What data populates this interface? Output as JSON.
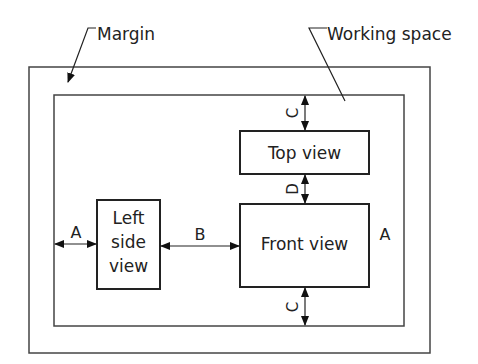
{
  "diagram": {
    "labels": {
      "margin": "Margin",
      "working_space": "Working space",
      "top_view": "Top view",
      "front_view": "Front view",
      "left_side_view_line1": "Left",
      "left_side_view_line2": "side",
      "left_side_view_line3": "view"
    },
    "dimensions": {
      "a_left": "A",
      "a_right": "A",
      "b": "B",
      "c_top": "C",
      "c_bottom": "C",
      "d": "D"
    },
    "colors": {
      "stroke": "#333333",
      "text": "#222222"
    }
  }
}
